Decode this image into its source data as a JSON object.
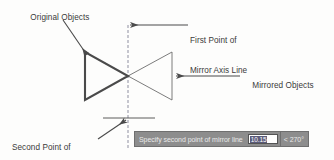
{
  "diagram": {
    "background_color": "#fdfdfc",
    "line_color": "#4a4a4a",
    "axis_color": "#9a9aa8",
    "annotations": {
      "original_objects": "Original Objects",
      "first_point_line1": "First Point of",
      "first_point_line2": "Mirror Axis Line",
      "mirrored_objects": "Mirrored Objects",
      "second_point_line1": "Second Point of",
      "second_point_line2": "Mirror Axis Line"
    },
    "shapes": {
      "original_triangle": {
        "name": "original-triangle",
        "points": "85,52 85,100 128,76",
        "stroke_width": 2.1,
        "stroke": "#4a4a4a"
      },
      "mirrored_triangle": {
        "name": "mirrored-triangle",
        "points": "172,52 172,100 128,76",
        "stroke_width": 0.9,
        "stroke": "#6d6d6d"
      },
      "mirror_axis": {
        "name": "mirror-axis-line",
        "x": 128,
        "y_top": 25,
        "y_bottom": 150,
        "dash": "3,2",
        "stroke": "#9a9aa8"
      },
      "crosshair": {
        "name": "crosshair-horizontal",
        "y": 118,
        "x_start": 103,
        "x_end": 155
      }
    }
  },
  "command_bar": {
    "prompt": "Specify second point of mirror line",
    "distance_value": "10.15",
    "angle_value": "< 270°",
    "background_color": "#8d8d8d",
    "input_background": "#ffffff",
    "selection_color": "#5b5b7a"
  }
}
